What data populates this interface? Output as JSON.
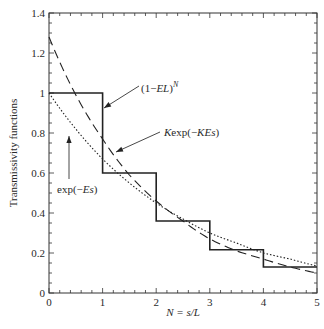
{
  "chart_data": {
    "type": "line",
    "title": "",
    "xlabel": "N = s/L",
    "ylabel": "Transmissivity functions",
    "xlim": [
      0,
      5
    ],
    "ylim": [
      0,
      1.4
    ],
    "xticks": [
      "0",
      "1",
      "2",
      "3",
      "4",
      "5"
    ],
    "yticks": [
      "0",
      "0.2",
      "0.4",
      "0.6",
      "0.8",
      "1",
      "1.2",
      "1.4"
    ],
    "grid": false,
    "series": [
      {
        "name": "(1−EL)^N",
        "style": "solid-step",
        "x": [
          0,
          1,
          1,
          2,
          2,
          3,
          3,
          4,
          4,
          5
        ],
        "y": [
          1.0,
          1.0,
          0.6,
          0.6,
          0.36,
          0.36,
          0.216,
          0.216,
          0.13,
          0.13
        ]
      },
      {
        "name": "Kexp(−KEs)",
        "style": "dashed",
        "x": [
          0,
          0.5,
          1,
          1.5,
          2,
          2.5,
          3,
          3.5,
          4,
          4.5,
          5
        ],
        "y": [
          1.28,
          0.99,
          0.77,
          0.59,
          0.46,
          0.36,
          0.27,
          0.21,
          0.17,
          0.13,
          0.1
        ]
      },
      {
        "name": "exp(−Es)",
        "style": "dotted",
        "x": [
          0,
          0.5,
          1,
          1.5,
          2,
          2.5,
          3,
          3.5,
          4,
          4.5,
          5
        ],
        "y": [
          1.0,
          0.82,
          0.67,
          0.55,
          0.45,
          0.37,
          0.3,
          0.25,
          0.2,
          0.17,
          0.135
        ]
      }
    ],
    "annotations": [
      {
        "label_pre": "(1−",
        "label_it": "EL",
        "label_post": ")",
        "label_sup": "N",
        "points_to": "step at N=1"
      },
      {
        "label_pre": "",
        "label_it": "K",
        "label_post": "exp(−",
        "label_it2": "KEs",
        "label_end": ")",
        "points_to": "dashed near N=1.1"
      },
      {
        "label_pre": "exp(−",
        "label_it": "Es",
        "label_post": ")",
        "points_to": "dotted near N=0.45"
      }
    ]
  }
}
